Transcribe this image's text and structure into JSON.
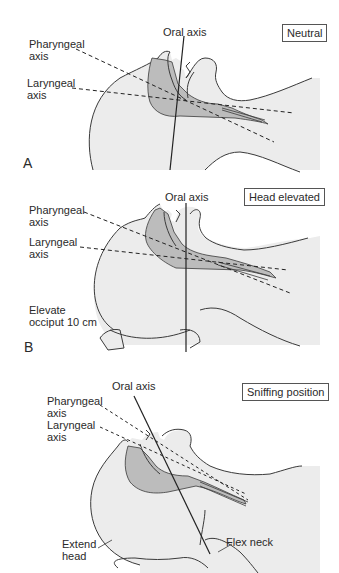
{
  "colors": {
    "background": "#ffffff",
    "head_fill": "#ececec",
    "airway_fill": "#bcbcbc",
    "outline": "#3a3a3a"
  },
  "panels": [
    {
      "letter": "A",
      "state": "Neutral",
      "labels": {
        "oral_axis": "Oral axis",
        "pharyngeal_axis_1": "Pharyngeal",
        "pharyngeal_axis_2": "axis",
        "laryngeal_axis_1": "Laryngeal",
        "laryngeal_axis_2": "axis"
      }
    },
    {
      "letter": "B",
      "state": "Head elevated",
      "labels": {
        "oral_axis": "Oral axis",
        "pharyngeal_axis_1": "Pharyngeal",
        "pharyngeal_axis_2": "axis",
        "laryngeal_axis_1": "Laryngeal",
        "laryngeal_axis_2": "axis",
        "elevate_1": "Elevate",
        "elevate_2": "occiput 10 cm"
      }
    },
    {
      "letter": "",
      "state": "Sniffing position",
      "labels": {
        "oral_axis": "Oral axis",
        "pharyngeal_axis_1": "Pharyngeal",
        "pharyngeal_axis_2": "axis",
        "laryngeal_axis_1": "Laryngeal",
        "laryngeal_axis_2": "axis",
        "extend_head_1": "Extend",
        "extend_head_2": "head",
        "flex_neck": "Flex neck"
      }
    }
  ]
}
